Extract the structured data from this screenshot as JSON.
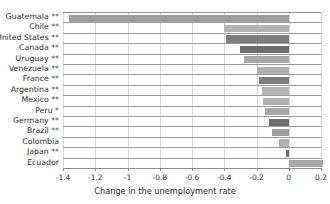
{
  "chart_data": {
    "type": "bar",
    "orientation": "horizontal",
    "title": "",
    "xlabel": "Change in the unemployment rate",
    "ylabel": "",
    "xlim": [
      -1.4,
      0.2
    ],
    "ylim": null,
    "grid": true,
    "legend": null,
    "xticks": [
      "-1.4",
      "-1.2",
      "-1",
      "-0.8",
      "-0.6",
      "-0.4",
      "-0.2",
      "0",
      "0.2"
    ],
    "xtick_values": [
      -1.4,
      -1.2,
      -1,
      -0.8,
      -0.6,
      -0.4,
      -0.2,
      0,
      0.2
    ],
    "categories": [
      "Guatemala **",
      "Chile **",
      "United States **",
      "Canada **",
      "Uruguay **",
      "Venezuela **",
      "France **",
      "Argentina **",
      "Mexico **",
      "Peru *",
      "Germany **",
      "Brazil **",
      "Colombia",
      "Japan **",
      "Ecuador"
    ],
    "values": [
      -1.36,
      -0.4,
      -0.39,
      -0.305,
      -0.28,
      -0.2,
      -0.185,
      -0.165,
      -0.16,
      -0.145,
      -0.12,
      -0.105,
      -0.06,
      -0.02,
      0.21
    ],
    "bar_colors": [
      "#9e9e9e",
      "#b2b2b2",
      "#7d7d7d",
      "#6e6e6e",
      "#a8a8a8",
      "#b0b0b0",
      "#7d7d7d",
      "#b6b6b6",
      "#b2b2b2",
      "#a8a8a8",
      "#6e6e6e",
      "#9e9e9e",
      "#b2b2b2",
      "#6e6e6e",
      "#a8a8a8"
    ]
  },
  "axis": {
    "x_title": "Change in the unemployment rate"
  },
  "colors": {
    "axis": "#8c8c8c",
    "grid": "#d8d8d8",
    "row_rule": "#9a9a9a",
    "text": "#2b2b2b",
    "background": "#ffffff"
  },
  "top_clipped_text": ""
}
